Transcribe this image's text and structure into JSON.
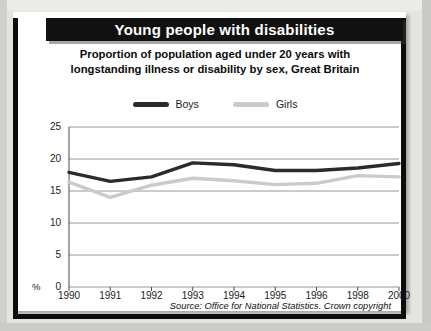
{
  "header": {
    "title": "Young people with disabilities"
  },
  "subtitle": {
    "line1": "Proportion of population aged under 20 years with",
    "line2": "longstanding illness or disability by sex, Great Britain"
  },
  "legend": [
    {
      "label": "Boys",
      "color": "#2b2b2b",
      "icon": "line-swatch-icon"
    },
    {
      "label": "Girls",
      "color": "#cbcbcb",
      "icon": "line-swatch-icon"
    }
  ],
  "axis": {
    "percent_symbol": "%",
    "y_ticks": [
      "25",
      "20",
      "15",
      "10",
      "5",
      "0"
    ],
    "x_ticks": [
      "1990",
      "1991",
      "1992",
      "1993",
      "1994",
      "1995",
      "1996",
      "1998",
      "2000"
    ]
  },
  "source": "Source: Office for National Statistics. Crown copyright",
  "colors": {
    "banner_background": "#111111",
    "banner_text": "#ffffff",
    "card_background": "#ffffff",
    "page_background": "#e4e4e1",
    "boys_line": "#2b2b2b",
    "girls_line": "#cbcbcb",
    "gridline": "#8a8a8a",
    "frame": "#0d0d0d"
  },
  "chart_data": {
    "type": "line",
    "title": "Young people with disabilities",
    "subtitle": "Proportion of population aged under 20 years with longstanding illness or disability by sex, Great Britain",
    "xlabel": "",
    "ylabel": "%",
    "ylim": [
      0,
      25
    ],
    "yticks": [
      0,
      5,
      10,
      15,
      20,
      25
    ],
    "grid": "horizontal",
    "legend_position": "top-center",
    "categories": [
      "1990",
      "1991",
      "1992",
      "1993",
      "1994",
      "1995",
      "1996",
      "1998",
      "2000"
    ],
    "series": [
      {
        "name": "Boys",
        "color": "#2b2b2b",
        "values": [
          17.9,
          16.5,
          17.2,
          19.4,
          19.1,
          18.2,
          18.2,
          18.6,
          19.3
        ]
      },
      {
        "name": "Girls",
        "color": "#cbcbcb",
        "values": [
          16.4,
          14.0,
          15.9,
          17.0,
          16.6,
          16.0,
          16.2,
          17.4,
          17.2
        ]
      }
    ],
    "annotations": [
      "Source: Office for National Statistics. Crown copyright"
    ]
  }
}
